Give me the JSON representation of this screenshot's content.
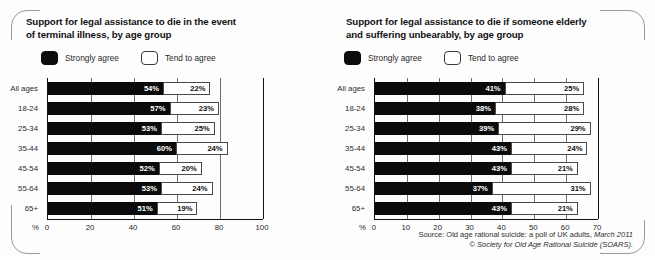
{
  "figure": {
    "source_line1_prefix": "Source: Old age rational suicide: a poll of UK adults,",
    "source_line1_italic": "March 2011",
    "source_line2": "© Society for Old Age Rational Suicide (SOARS)."
  },
  "legend": {
    "strongly_agree": "Strongly agree",
    "tend_to_agree": "Tend to agree",
    "strongly_agree_color": "#0b0b0b",
    "tend_to_agree_color": "#ffffff"
  },
  "axis": {
    "percent_symbol": "%"
  },
  "chart_data": [
    {
      "id": "terminal-illness",
      "type": "bar",
      "orientation": "horizontal",
      "stacked": true,
      "title": "Support for legal assistance to die in the event\nof terminal illness, by age group",
      "xlabel": "%",
      "ylabel": "",
      "xlim": [
        0,
        100
      ],
      "xticks": [
        0,
        20,
        40,
        60,
        80,
        100
      ],
      "xtick_labels": [
        "0",
        "20",
        "40",
        "60",
        "80",
        "100"
      ],
      "grid": true,
      "legend_position": "above-plot",
      "categories": [
        "All ages",
        "18-24",
        "25-34",
        "35-44",
        "45-54",
        "55-64",
        "65+"
      ],
      "series": [
        {
          "name": "Strongly agree",
          "color": "#0b0b0b",
          "values": [
            54,
            57,
            53,
            60,
            52,
            53,
            51
          ],
          "labels": [
            "54%",
            "57%",
            "53%",
            "60%",
            "52%",
            "53%",
            "51%"
          ]
        },
        {
          "name": "Tend to agree",
          "color": "#ffffff",
          "values": [
            22,
            23,
            25,
            24,
            20,
            24,
            19
          ],
          "labels": [
            "22%",
            "23%",
            "25%",
            "24%",
            "20%",
            "24%",
            "19%"
          ]
        }
      ]
    },
    {
      "id": "elderly-suffering",
      "type": "bar",
      "orientation": "horizontal",
      "stacked": true,
      "title": "Support for legal assistance to die if someone elderly\nand suffering unbearably, by age group",
      "xlabel": "%",
      "ylabel": "",
      "xlim": [
        0,
        70
      ],
      "xticks": [
        0,
        10,
        20,
        30,
        40,
        50,
        60,
        70
      ],
      "xtick_labels": [
        "0",
        "10",
        "20",
        "30",
        "40",
        "50",
        "60",
        "70"
      ],
      "grid": true,
      "legend_position": "above-plot",
      "categories": [
        "All ages",
        "18-24",
        "25-34",
        "35-44",
        "45-54",
        "55-64",
        "65+"
      ],
      "series": [
        {
          "name": "Strongly agree",
          "color": "#0b0b0b",
          "values": [
            41,
            38,
            39,
            43,
            43,
            37,
            43
          ],
          "labels": [
            "41%",
            "38%",
            "39%",
            "43%",
            "43%",
            "37%",
            "43%"
          ]
        },
        {
          "name": "Tend to agree",
          "color": "#ffffff",
          "values": [
            25,
            28,
            29,
            24,
            21,
            31,
            21
          ],
          "labels": [
            "25%",
            "28%",
            "29%",
            "24%",
            "21%",
            "31%",
            "21%"
          ]
        }
      ]
    }
  ]
}
